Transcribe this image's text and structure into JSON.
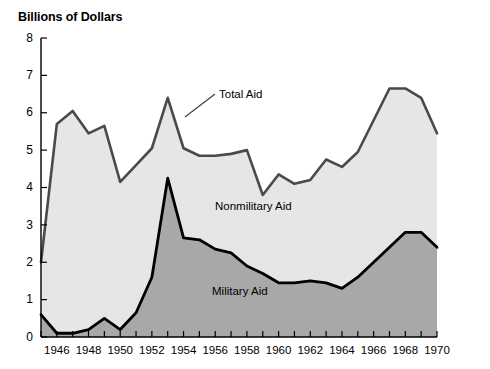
{
  "chart_data": {
    "type": "area",
    "title": "Billions of Dollars",
    "xlabel": "",
    "ylabel": "Billions of Dollars",
    "stacked": true,
    "grid": false,
    "legend_position": "inline-annotations",
    "xlim": [
      1945,
      1970
    ],
    "ylim": [
      0,
      8
    ],
    "ytick_values": [
      0,
      1,
      2,
      3,
      4,
      5,
      6,
      7,
      8
    ],
    "ytick_labels": [
      "0",
      "1",
      "2",
      "3",
      "4",
      "5",
      "6",
      "7",
      "8"
    ],
    "x": [
      1945,
      1946,
      1947,
      1948,
      1949,
      1950,
      1951,
      1952,
      1953,
      1954,
      1955,
      1956,
      1957,
      1958,
      1959,
      1960,
      1961,
      1962,
      1963,
      1964,
      1965,
      1966,
      1967,
      1968,
      1969,
      1970
    ],
    "xtick_values": [
      1945,
      1946,
      1947,
      1948,
      1949,
      1950,
      1951,
      1952,
      1953,
      1954,
      1955,
      1956,
      1957,
      1958,
      1959,
      1960,
      1961,
      1962,
      1963,
      1964,
      1965,
      1966,
      1967,
      1968,
      1969,
      1970
    ],
    "xtick_labels": [
      "1946",
      "1948",
      "1950",
      "1952",
      "1954",
      "1956",
      "1958",
      "1960",
      "1962",
      "1964",
      "1966",
      "1968",
      "1970"
    ],
    "xtick_labeled_values": [
      1946,
      1948,
      1950,
      1952,
      1954,
      1956,
      1958,
      1960,
      1962,
      1964,
      1966,
      1968,
      1970
    ],
    "series": [
      {
        "name": "Military Aid",
        "color": "#a8a8a8",
        "line_color": "#000000",
        "values": [
          0.6,
          0.1,
          0.1,
          0.2,
          0.5,
          0.2,
          0.65,
          1.6,
          4.25,
          2.65,
          2.6,
          2.35,
          2.25,
          1.9,
          1.7,
          1.45,
          1.45,
          1.5,
          1.45,
          1.3,
          1.6,
          2.0,
          2.4,
          2.8,
          2.8,
          2.4
        ]
      },
      {
        "name": "Nonmilitary Aid",
        "color": "#e6e6e6",
        "line_color": "#000000",
        "values": [
          1.4,
          5.6,
          5.95,
          5.25,
          5.15,
          3.95,
          3.95,
          3.45,
          2.15,
          2.4,
          2.25,
          2.5,
          2.65,
          3.1,
          2.1,
          2.9,
          2.65,
          2.7,
          3.3,
          3.25,
          3.35,
          3.8,
          4.25,
          3.85,
          3.6,
          3.05
        ]
      }
    ],
    "total_series": {
      "name": "Total Aid",
      "line_color": "#4a4a4a",
      "values": [
        2.0,
        5.7,
        6.05,
        5.45,
        5.65,
        4.15,
        4.6,
        5.05,
        6.4,
        5.05,
        4.85,
        4.85,
        4.9,
        5.0,
        3.8,
        4.35,
        4.1,
        4.2,
        4.75,
        4.55,
        4.95,
        5.8,
        6.65,
        6.65,
        6.4,
        5.45
      ]
    },
    "annotations": [
      {
        "text": "Total Aid",
        "x_px": 219,
        "y_px": 98
      },
      {
        "text": "Nonmilitary Aid",
        "x_px": 215,
        "y_px": 210
      },
      {
        "text": "Military Aid",
        "x_px": 212,
        "y_px": 295
      }
    ]
  },
  "colors": {
    "military_fill": "#a8a8a8",
    "nonmilitary_fill": "#e6e6e6",
    "total_line": "#4a4a4a",
    "military_line": "#000000",
    "axis": "#000000",
    "background": "#ffffff"
  }
}
